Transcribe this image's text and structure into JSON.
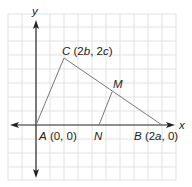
{
  "diagram": {
    "type": "coordinate-geometry",
    "axes": {
      "x_label": "x",
      "y_label": "y"
    },
    "points": {
      "A": {
        "name": "A",
        "coords": "(0, 0)"
      },
      "B": {
        "name": "B",
        "coords_pre": "(2",
        "var": "a",
        "coords_post": ", 0)"
      },
      "C": {
        "name": "C",
        "coords_pre": "(2",
        "var1": "b",
        "mid": ", 2",
        "var2": "c",
        "coords_post": ")"
      },
      "M": {
        "name": "M"
      },
      "N": {
        "name": "N"
      }
    },
    "segments": [
      "AC",
      "CB",
      "AB",
      "MN"
    ],
    "colors": {
      "grid": "#e2e2e2",
      "axis": "#222222",
      "triangle": "#777777"
    }
  }
}
